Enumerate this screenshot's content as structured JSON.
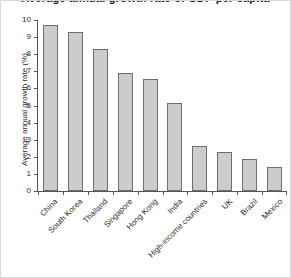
{
  "chart_data": {
    "type": "bar",
    "title": "Average annual growth rate of GDP per capita",
    "xlabel": "",
    "ylabel": "Average annual growth rate (%)",
    "categories": [
      "China",
      "South Korea",
      "Thailand",
      "Singapore",
      "Hong Kong",
      "India",
      "High-income countries",
      "UK",
      "Brazil",
      "Mexico"
    ],
    "values": [
      9.7,
      9.3,
      8.3,
      6.9,
      6.55,
      5.15,
      2.65,
      2.3,
      1.85,
      1.4
    ],
    "ylim": [
      0,
      10
    ],
    "yticks": [
      0,
      1,
      2,
      3,
      4,
      5,
      6,
      7,
      8,
      9,
      10
    ],
    "ytick_labels": [
      "0",
      "1",
      "2",
      "3",
      "4",
      "5",
      "6",
      "7",
      "8",
      "9",
      "10"
    ],
    "grid": false,
    "legend": false,
    "bar_color": "#cccccc",
    "bar_edge_color": "#6e6e6e",
    "axis_color": "#555555",
    "text_color": "#2b2b2b",
    "background": "#ffffff",
    "frame_color": "#d8d8d8"
  }
}
